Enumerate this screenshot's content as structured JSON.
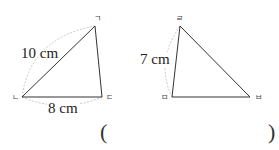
{
  "figures": {
    "triangle1": {
      "vertices": {
        "top": {
          "label": "ㄱ",
          "x": 95,
          "y": 26
        },
        "bottom_left": {
          "label": "ㄴ",
          "x": 22,
          "y": 97
        },
        "bottom_right": {
          "label": "ㄷ",
          "x": 102,
          "y": 97
        }
      },
      "lengths": {
        "side_ngieun_giyeok": "10 cm",
        "side_nieun_digeut": "8 cm"
      }
    },
    "triangle2": {
      "vertices": {
        "top": {
          "label": "ㄹ",
          "x": 180,
          "y": 26
        },
        "bottom_left": {
          "label": "ㅁ",
          "x": 172,
          "y": 97
        },
        "bottom_right": {
          "label": "ㅂ",
          "x": 250,
          "y": 97
        }
      },
      "lengths": {
        "side_rieul_mieum": "7 cm"
      }
    }
  },
  "answer": {
    "open_paren": "(",
    "close_paren": ")",
    "value": ""
  },
  "colors": {
    "line": "#333333",
    "arc": "#c8c8c8"
  }
}
